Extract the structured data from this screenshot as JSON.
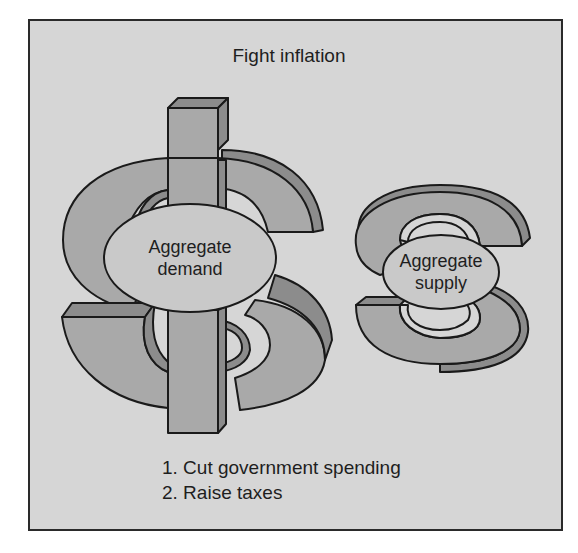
{
  "figure": {
    "title": "Fight inflation",
    "colors": {
      "background": "#d6d6d6",
      "symbol_face": "#a9a9a9",
      "symbol_side": "#8c8c8c",
      "ellipse_fill": "#c9c9c9",
      "outline": "#1a1a1a"
    }
  },
  "shapes": {
    "dollar": {
      "symbol": "$",
      "label_line1": "Aggregate",
      "label_line2": "demand"
    },
    "s_symbol": {
      "symbol": "S",
      "label_line1": "Aggregate",
      "label_line2": "supply"
    }
  },
  "policy_list": {
    "items": [
      "1. Cut government spending",
      "2. Raise taxes"
    ]
  }
}
